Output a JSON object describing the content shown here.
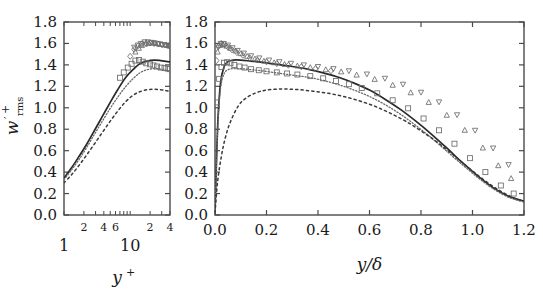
{
  "figure": {
    "title": "",
    "ylabel_main": "w",
    "ylabel_prime": "′",
    "ylabel_sub": "rms",
    "ylabel_sup": "+",
    "background": "#ffffff",
    "line_color": "#2a2a2a",
    "symbol_color": "#6b6b6b"
  },
  "chart_data": [
    {
      "type": "line",
      "panel": "left",
      "title": "",
      "xlabel": "y+",
      "ylabel": "w'_rms^+",
      "xscale": "log",
      "xlim": [
        1,
        40
      ],
      "ylim": [
        0.0,
        1.8
      ],
      "grid": false,
      "legend": "none",
      "ytick_labels": [
        "0.0",
        "0.2",
        "0.4",
        "0.6",
        "0.8",
        "1.0",
        "1.2",
        "1.4",
        "1.6",
        "1.8"
      ],
      "ytick_values": [
        0.0,
        0.2,
        0.4,
        0.6,
        0.8,
        1.0,
        1.2,
        1.4,
        1.6,
        1.8
      ],
      "xtick_minor_labels": [
        "2",
        "4",
        "6",
        "2",
        "4"
      ],
      "xtick_minor_values": [
        2,
        4,
        6,
        20,
        40
      ],
      "xtick_decade_labels": [
        "1",
        "10"
      ],
      "xtick_decade_values": [
        1,
        10
      ],
      "series": [
        {
          "name": "solid",
          "style": "solid",
          "x": [
            1.0,
            1.3,
            1.7,
            2.2,
            2.9,
            3.8,
            5.0,
            6.5,
            8.5,
            11.0,
            14.0,
            18.0,
            23.0,
            29.0,
            35.0,
            40.0
          ],
          "values": [
            0.345,
            0.44,
            0.55,
            0.66,
            0.79,
            0.92,
            1.05,
            1.17,
            1.28,
            1.355,
            1.41,
            1.435,
            1.445,
            1.44,
            1.432,
            1.428
          ]
        },
        {
          "name": "fine-dotted",
          "style": "dotted",
          "x": [
            1.0,
            1.3,
            1.7,
            2.2,
            2.9,
            3.8,
            5.0,
            6.5,
            8.5,
            11.0,
            14.0,
            18.0,
            23.0,
            29.0,
            35.0,
            40.0
          ],
          "values": [
            0.33,
            0.42,
            0.52,
            0.63,
            0.755,
            0.875,
            0.995,
            1.1,
            1.195,
            1.27,
            1.325,
            1.355,
            1.365,
            1.36,
            1.35,
            1.345
          ]
        },
        {
          "name": "coarse-dashed",
          "style": "dashed",
          "x": [
            1.0,
            1.3,
            1.7,
            2.2,
            2.9,
            3.8,
            5.0,
            6.5,
            8.5,
            11.0,
            14.0,
            18.0,
            23.0,
            29.0,
            35.0,
            40.0
          ],
          "values": [
            0.3,
            0.375,
            0.465,
            0.56,
            0.665,
            0.77,
            0.875,
            0.97,
            1.055,
            1.115,
            1.15,
            1.168,
            1.172,
            1.168,
            1.16,
            1.155
          ]
        }
      ],
      "scatter": [
        {
          "name": "squares",
          "marker": "square",
          "x": [
            7.0,
            8.0,
            9.2,
            10.5,
            12.0,
            13.6,
            15.5,
            17.5,
            20.0,
            22.5,
            25.5,
            29.0,
            33.0,
            37.0,
            40.0
          ],
          "values": [
            1.28,
            1.33,
            1.375,
            1.41,
            1.44,
            1.445,
            1.43,
            1.415,
            1.405,
            1.395,
            1.385,
            1.375,
            1.37,
            1.365,
            1.36
          ]
        },
        {
          "name": "triangles-up",
          "marker": "triangle-up",
          "x": [
            12.0,
            13.5,
            15.0,
            17.0,
            19.0,
            21.5,
            24.0,
            27.0,
            30.0,
            34.0,
            38.0,
            40.0
          ],
          "values": [
            1.52,
            1.555,
            1.58,
            1.595,
            1.6,
            1.605,
            1.6,
            1.595,
            1.59,
            1.585,
            1.58,
            1.575
          ]
        },
        {
          "name": "triangles-down",
          "marker": "triangle-down",
          "x": [
            11.5,
            13.0,
            14.5,
            16.5,
            18.5,
            21.0,
            23.5,
            26.5,
            30.0,
            33.5,
            37.5,
            40.0
          ],
          "values": [
            1.565,
            1.585,
            1.6,
            1.615,
            1.615,
            1.61,
            1.605,
            1.6,
            1.59,
            1.585,
            1.58,
            1.575
          ]
        },
        {
          "name": "diamonds",
          "marker": "diamond",
          "x": [
            10.0,
            11.5,
            13.0,
            15.0,
            17.5,
            20.0,
            23.0,
            26.5,
            30.5,
            35.0,
            40.0
          ],
          "values": [
            1.48,
            1.545,
            1.575,
            1.595,
            1.6,
            1.605,
            1.6,
            1.595,
            1.59,
            1.585,
            1.58
          ]
        }
      ]
    },
    {
      "type": "line",
      "panel": "right",
      "title": "",
      "xlabel": "y/δ",
      "ylabel": "w'_rms^+",
      "xscale": "linear",
      "xlim": [
        0.0,
        1.2
      ],
      "ylim": [
        0.0,
        1.8
      ],
      "grid": false,
      "legend": "none",
      "xtick_labels": [
        "0.0",
        "0.2",
        "0.4",
        "0.6",
        "0.8",
        "1.0",
        "1.2"
      ],
      "xtick_values": [
        0.0,
        0.2,
        0.4,
        0.6,
        0.8,
        1.0,
        1.2
      ],
      "ytick_labels": [
        "0.0",
        "0.2",
        "0.4",
        "0.6",
        "0.8",
        "1.0",
        "1.2",
        "1.4",
        "1.6",
        "1.8"
      ],
      "ytick_values": [
        0.0,
        0.2,
        0.4,
        0.6,
        0.8,
        1.0,
        1.2,
        1.4,
        1.6,
        1.8
      ],
      "series": [
        {
          "name": "solid",
          "style": "solid",
          "x": [
            0.0,
            0.005,
            0.012,
            0.022,
            0.035,
            0.05,
            0.07,
            0.1,
            0.14,
            0.18,
            0.24,
            0.3,
            0.36,
            0.42,
            0.48,
            0.54,
            0.6,
            0.66,
            0.72,
            0.78,
            0.84,
            0.9,
            0.96,
            1.02,
            1.08,
            1.14,
            1.2
          ],
          "values": [
            0.02,
            0.44,
            0.92,
            1.24,
            1.38,
            1.43,
            1.445,
            1.445,
            1.435,
            1.425,
            1.405,
            1.385,
            1.36,
            1.325,
            1.285,
            1.23,
            1.165,
            1.08,
            0.985,
            0.875,
            0.755,
            0.625,
            0.49,
            0.365,
            0.255,
            0.175,
            0.13
          ]
        },
        {
          "name": "fine-dotted",
          "style": "dotted",
          "x": [
            0.0,
            0.005,
            0.012,
            0.022,
            0.035,
            0.05,
            0.07,
            0.1,
            0.14,
            0.18,
            0.24,
            0.3,
            0.36,
            0.42,
            0.48,
            0.54,
            0.6,
            0.66,
            0.72,
            0.78,
            0.84,
            0.9,
            0.96,
            1.02,
            1.08,
            1.14,
            1.2
          ],
          "values": [
            0.02,
            0.42,
            0.88,
            1.19,
            1.315,
            1.355,
            1.365,
            1.365,
            1.355,
            1.345,
            1.325,
            1.305,
            1.285,
            1.255,
            1.215,
            1.165,
            1.105,
            1.03,
            0.94,
            0.835,
            0.72,
            0.595,
            0.47,
            0.35,
            0.245,
            0.165,
            0.12
          ]
        },
        {
          "name": "coarse-dashed",
          "style": "dashed",
          "x": [
            0.0,
            0.01,
            0.025,
            0.04,
            0.06,
            0.09,
            0.12,
            0.16,
            0.2,
            0.26,
            0.32,
            0.38,
            0.44,
            0.5,
            0.56,
            0.62,
            0.68,
            0.74,
            0.8,
            0.86,
            0.92,
            0.98,
            1.04,
            1.1,
            1.16,
            1.2
          ],
          "values": [
            0.02,
            0.31,
            0.55,
            0.72,
            0.87,
            1.015,
            1.09,
            1.14,
            1.165,
            1.175,
            1.17,
            1.155,
            1.135,
            1.105,
            1.065,
            1.015,
            0.95,
            0.875,
            0.785,
            0.685,
            0.57,
            0.45,
            0.335,
            0.235,
            0.16,
            0.125
          ]
        }
      ],
      "scatter": [
        {
          "name": "squares",
          "marker": "square",
          "x": [
            0.008,
            0.016,
            0.025,
            0.035,
            0.047,
            0.06,
            0.075,
            0.095,
            0.115,
            0.14,
            0.17,
            0.2,
            0.24,
            0.28,
            0.32,
            0.37,
            0.42,
            0.47,
            0.52,
            0.57,
            0.63,
            0.69,
            0.75,
            0.81,
            0.87,
            0.93,
            0.99,
            1.05,
            1.11,
            1.16
          ],
          "values": [
            1.05,
            1.27,
            1.38,
            1.42,
            1.425,
            1.415,
            1.4,
            1.385,
            1.375,
            1.36,
            1.35,
            1.34,
            1.33,
            1.32,
            1.31,
            1.295,
            1.275,
            1.25,
            1.22,
            1.185,
            1.135,
            1.07,
            0.995,
            0.9,
            0.79,
            0.665,
            0.53,
            0.4,
            0.275,
            0.2
          ]
        },
        {
          "name": "triangles-up",
          "marker": "triangle-up",
          "x": [
            0.01,
            0.02,
            0.03,
            0.045,
            0.06,
            0.08,
            0.1,
            0.125,
            0.155,
            0.19,
            0.23,
            0.27,
            0.32,
            0.37,
            0.43,
            0.49,
            0.55,
            0.62,
            0.69,
            0.76,
            0.83,
            0.9,
            0.97,
            1.04,
            1.1,
            1.15
          ],
          "values": [
            1.52,
            1.58,
            1.59,
            1.575,
            1.555,
            1.53,
            1.505,
            1.48,
            1.455,
            1.435,
            1.42,
            1.405,
            1.39,
            1.375,
            1.355,
            1.335,
            1.305,
            1.265,
            1.21,
            1.14,
            1.05,
            0.93,
            0.79,
            0.625,
            0.46,
            0.34
          ]
        },
        {
          "name": "triangles-down",
          "marker": "triangle-down",
          "x": [
            0.012,
            0.022,
            0.034,
            0.05,
            0.068,
            0.088,
            0.112,
            0.14,
            0.172,
            0.21,
            0.25,
            0.295,
            0.345,
            0.4,
            0.46,
            0.52,
            0.59,
            0.66,
            0.73,
            0.8,
            0.87,
            0.94,
            1.01,
            1.08,
            1.14
          ],
          "values": [
            1.565,
            1.6,
            1.6,
            1.585,
            1.56,
            1.535,
            1.51,
            1.485,
            1.465,
            1.445,
            1.43,
            1.415,
            1.4,
            1.385,
            1.365,
            1.345,
            1.315,
            1.275,
            1.22,
            1.145,
            1.055,
            0.935,
            0.79,
            0.625,
            0.47
          ]
        },
        {
          "name": "diamonds",
          "marker": "diamond",
          "x": [
            0.006,
            0.014,
            0.024,
            0.036,
            0.05,
            0.066,
            0.085,
            0.108,
            0.135,
            0.165,
            0.2,
            0.24,
            0.285,
            0.335,
            0.39,
            0.45
          ],
          "values": [
            1.44,
            1.575,
            1.6,
            1.59,
            1.565,
            1.54,
            1.515,
            1.49,
            1.465,
            1.445,
            1.428,
            1.412,
            1.397,
            1.382,
            1.365,
            1.345
          ]
        }
      ]
    }
  ]
}
